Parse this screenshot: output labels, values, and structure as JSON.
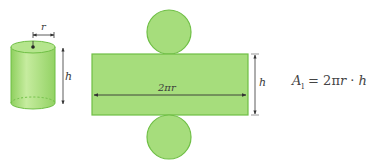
{
  "diagram": {
    "colors": {
      "fill": "#a6dd7c",
      "fill_light": "#c3ea9f",
      "stroke": "#6fbf45",
      "arrow": "#333333",
      "text": "#3a3a3a"
    },
    "cylinder": {
      "radius_label": "r",
      "height_label": "h"
    },
    "net": {
      "top_circle": "circle",
      "rectangle_width_label": "2πr",
      "rectangle_height_label": "h",
      "bottom_circle": "circle"
    },
    "formula": {
      "lhs": "A",
      "lhs_sub": "l",
      "equals": " = 2π",
      "r": "r",
      "dot": " · ",
      "h": "h"
    }
  }
}
